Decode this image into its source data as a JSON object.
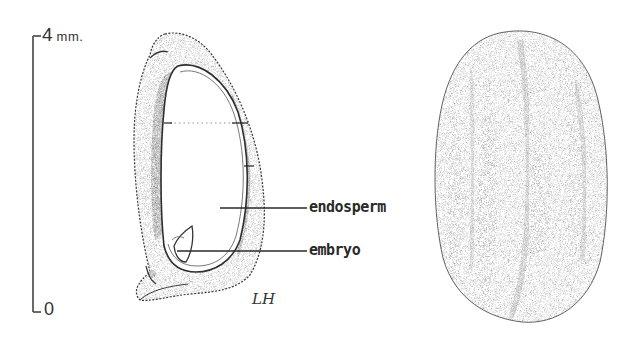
{
  "figure": {
    "scale_bar": {
      "max_value": "4",
      "unit": "mm.",
      "min_value": "0"
    },
    "section_view": {
      "labels": [
        {
          "text": "endosperm"
        },
        {
          "text": "embryo"
        }
      ]
    },
    "artist_initials": "LH",
    "exterior_view": {}
  },
  "colors": {
    "ink": "#2a2a2a",
    "stipple_light": "#9a9a9a",
    "stipple_dark": "#1e1e1e",
    "background": "#ffffff"
  }
}
